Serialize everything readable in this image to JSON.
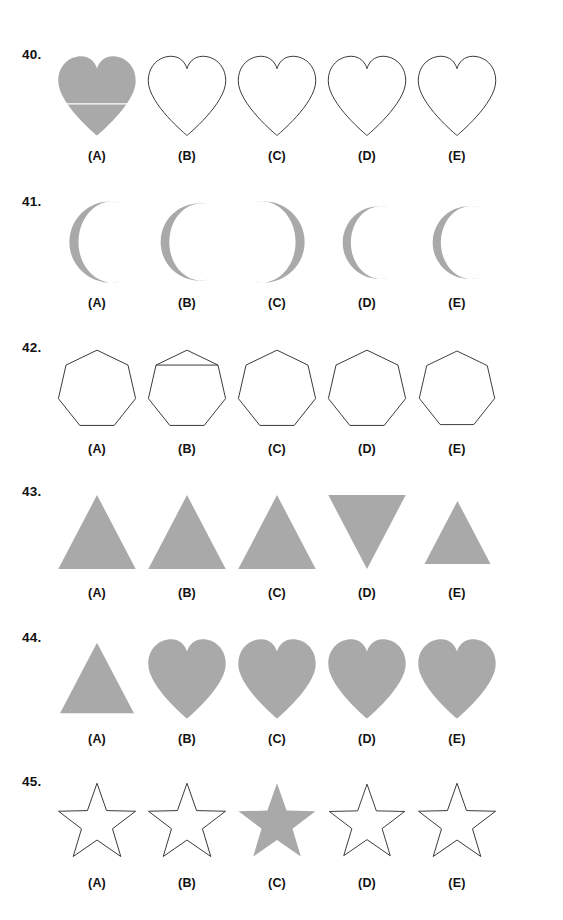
{
  "page": {
    "background_color": "#ffffff",
    "fill_color": "#a9a9a9",
    "stroke_color": "#333333",
    "text_color": "#121212",
    "width": 563,
    "height": 920,
    "kind": "shape-matching-worksheet"
  },
  "option_labels": [
    "(A)",
    "(B)",
    "(C)",
    "(D)",
    "(E)"
  ],
  "rows": [
    {
      "number": "40.",
      "top": 45,
      "shape": "heart",
      "cells": [
        {
          "label": "(A)",
          "shape": "heart",
          "style": "filled",
          "size": 1.0,
          "detail": "horizontal-crease-line"
        },
        {
          "label": "(B)",
          "shape": "heart",
          "style": "outline",
          "size": 1.0,
          "detail": ""
        },
        {
          "label": "(C)",
          "shape": "heart",
          "style": "outline",
          "size": 1.0,
          "detail": ""
        },
        {
          "label": "(D)",
          "shape": "heart",
          "style": "outline",
          "size": 1.0,
          "detail": ""
        },
        {
          "label": "(E)",
          "shape": "heart",
          "style": "outline",
          "size": 1.0,
          "detail": ""
        }
      ]
    },
    {
      "number": "41.",
      "top": 192,
      "shape": "crescent",
      "cells": [
        {
          "label": "(A)",
          "shape": "crescent",
          "style": "filled",
          "size": 1.0,
          "facing": "right"
        },
        {
          "label": "(B)",
          "shape": "crescent",
          "style": "filled",
          "size": 0.95,
          "facing": "right"
        },
        {
          "label": "(C)",
          "shape": "crescent",
          "style": "filled",
          "size": 1.0,
          "facing": "left"
        },
        {
          "label": "(D)",
          "shape": "crescent",
          "style": "filled",
          "size": 0.9,
          "facing": "right"
        },
        {
          "label": "(E)",
          "shape": "crescent",
          "style": "filled",
          "size": 0.9,
          "facing": "right"
        }
      ]
    },
    {
      "number": "42.",
      "top": 338,
      "shape": "heptagon",
      "cells": [
        {
          "label": "(A)",
          "shape": "heptagon",
          "style": "outline",
          "size": 1.0,
          "detail": ""
        },
        {
          "label": "(B)",
          "shape": "heptagon",
          "style": "outline",
          "size": 1.0,
          "detail": "horizontal-chord-line"
        },
        {
          "label": "(C)",
          "shape": "heptagon",
          "style": "outline",
          "size": 1.0,
          "detail": ""
        },
        {
          "label": "(D)",
          "shape": "heptagon",
          "style": "outline",
          "size": 1.0,
          "detail": ""
        },
        {
          "label": "(E)",
          "shape": "heptagon",
          "style": "outline",
          "size": 0.98,
          "detail": ""
        }
      ]
    },
    {
      "number": "43.",
      "top": 482,
      "shape": "triangle",
      "cells": [
        {
          "label": "(A)",
          "shape": "triangle",
          "style": "filled",
          "size": 1.0,
          "orientation": "up"
        },
        {
          "label": "(B)",
          "shape": "triangle",
          "style": "filled",
          "size": 1.0,
          "orientation": "up"
        },
        {
          "label": "(C)",
          "shape": "triangle",
          "style": "filled",
          "size": 1.0,
          "orientation": "up"
        },
        {
          "label": "(D)",
          "shape": "triangle",
          "style": "filled",
          "size": 1.0,
          "orientation": "down"
        },
        {
          "label": "(E)",
          "shape": "triangle",
          "style": "filled",
          "size": 0.85,
          "orientation": "up"
        }
      ]
    },
    {
      "number": "44.",
      "top": 628,
      "shape": "heart",
      "cells": [
        {
          "label": "(A)",
          "shape": "triangle",
          "style": "filled",
          "size": 0.95,
          "orientation": "up"
        },
        {
          "label": "(B)",
          "shape": "heart",
          "style": "filled",
          "size": 1.0,
          "detail": ""
        },
        {
          "label": "(C)",
          "shape": "heart",
          "style": "filled",
          "size": 1.0,
          "detail": ""
        },
        {
          "label": "(D)",
          "shape": "heart",
          "style": "filled",
          "size": 1.0,
          "detail": ""
        },
        {
          "label": "(E)",
          "shape": "heart",
          "style": "filled",
          "size": 1.0,
          "detail": ""
        }
      ]
    },
    {
      "number": "45.",
      "top": 772,
      "shape": "star",
      "cells": [
        {
          "label": "(A)",
          "shape": "star",
          "style": "outline",
          "size": 1.0,
          "detail": ""
        },
        {
          "label": "(B)",
          "shape": "star",
          "style": "outline",
          "size": 1.0,
          "detail": ""
        },
        {
          "label": "(C)",
          "shape": "star",
          "style": "filled",
          "size": 1.0,
          "detail": ""
        },
        {
          "label": "(D)",
          "shape": "star",
          "style": "outline",
          "size": 0.98,
          "detail": ""
        },
        {
          "label": "(E)",
          "shape": "star",
          "style": "outline",
          "size": 1.0,
          "detail": ""
        }
      ]
    }
  ]
}
